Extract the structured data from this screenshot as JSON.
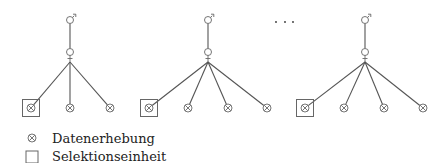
{
  "diagram": {
    "trees": [
      {
        "id": "tree-1",
        "root": {
          "x": 70,
          "label": "male"
        },
        "mid": {
          "x": 70,
          "label": "female"
        },
        "leaves": [
          {
            "x": 31,
            "selected": true
          },
          {
            "x": 70,
            "selected": false
          },
          {
            "x": 110,
            "selected": false
          }
        ]
      },
      {
        "id": "tree-2",
        "root": {
          "x": 208,
          "label": "male"
        },
        "mid": {
          "x": 208,
          "label": "female"
        },
        "leaves": [
          {
            "x": 149,
            "selected": true
          },
          {
            "x": 188,
            "selected": false
          },
          {
            "x": 228,
            "selected": false
          },
          {
            "x": 267,
            "selected": false
          }
        ]
      },
      {
        "id": "tree-3",
        "root": {
          "x": 365,
          "label": "male"
        },
        "mid": {
          "x": 365,
          "label": "female"
        },
        "leaves": [
          {
            "x": 305,
            "selected": true
          },
          {
            "x": 344,
            "selected": false
          },
          {
            "x": 384,
            "selected": false
          },
          {
            "x": 423,
            "selected": false
          }
        ]
      }
    ],
    "ellipsis": "· · ·",
    "colors": {
      "line": "#555555",
      "symbol": "#666666",
      "text": "#222222"
    }
  },
  "legend": {
    "items": [
      {
        "symbol": "otimes-icon",
        "label": "Datenerhebung"
      },
      {
        "symbol": "square-icon",
        "label": "Selektionseinheit"
      }
    ]
  }
}
